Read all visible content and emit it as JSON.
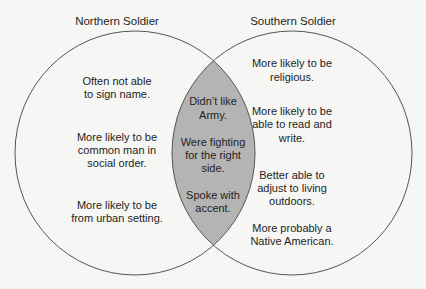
{
  "diagram": {
    "type": "venn",
    "colors": {
      "background": "#f6f6f4",
      "outline": "#555555",
      "overlap_fill": "#b4b4b4",
      "text": "#1e1e1e"
    },
    "left": {
      "title": "Northern Soldier",
      "items": [
        [
          "Often not able",
          "to sign name."
        ],
        [
          "More likely to be",
          "common man in",
          "social order."
        ],
        [
          "More likely to be",
          "from urban setting."
        ]
      ]
    },
    "overlap": {
      "items": [
        [
          "Didn’t like",
          "Army."
        ],
        [
          "Were fighting",
          "for the right",
          "side."
        ],
        [
          "Spoke with",
          "accent."
        ]
      ]
    },
    "right": {
      "title": "Southern Soldier",
      "items": [
        [
          "More likely to be",
          "religious."
        ],
        [
          "More likely to be",
          "able to read and",
          "write."
        ],
        [
          "Better able to",
          "adjust to living",
          "outdoors."
        ],
        [
          "More probably a",
          "Native American."
        ]
      ]
    }
  }
}
